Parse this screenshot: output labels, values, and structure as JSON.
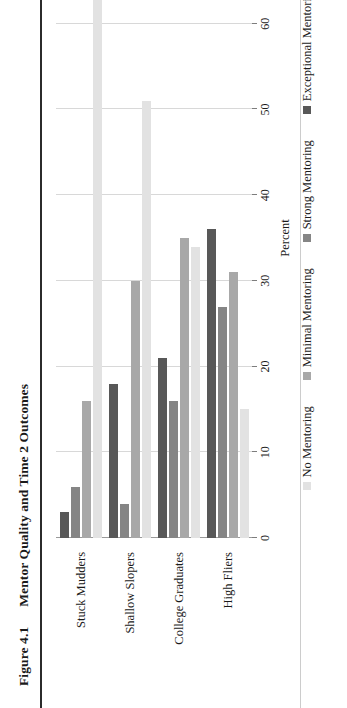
{
  "figure": {
    "number": "Figure 4.1",
    "title": "Mentor Quality and Time 2 Outcomes"
  },
  "chart_data": {
    "type": "bar",
    "orientation": "horizontal",
    "title": "Mentor Quality and Time 2 Outcomes",
    "xlabel": "",
    "ylabel": "Percent",
    "ylim": [
      0,
      70
    ],
    "yticks": [
      0,
      10,
      20,
      30,
      40,
      50,
      60,
      70
    ],
    "grid": true,
    "legend_position": "bottom",
    "categories": [
      "Stuck Mudders",
      "Shallow Slopers",
      "College Graduates",
      "High Fliers"
    ],
    "series": [
      {
        "name": "No Mentoring",
        "color": "#e2e2e2",
        "values": [
          70,
          51,
          34,
          15
        ]
      },
      {
        "name": "Minimal Mentoring",
        "color": "#a8a8a8",
        "values": [
          16,
          30,
          35,
          31
        ]
      },
      {
        "name": "Strong Mentoring",
        "color": "#858585",
        "values": [
          6,
          4,
          16,
          27
        ]
      },
      {
        "name": "Exceptional Mentoring",
        "color": "#585858",
        "values": [
          3,
          18,
          21,
          36
        ]
      }
    ]
  },
  "axis": {
    "label": "Percent",
    "ticks": [
      "0",
      "10",
      "20",
      "30",
      "40",
      "50",
      "60",
      "70"
    ]
  },
  "legend": {
    "items": [
      {
        "label": "No Mentoring",
        "color": "#e2e2e2"
      },
      {
        "label": "Minimal Mentoring",
        "color": "#a8a8a8"
      },
      {
        "label": "Strong Mentoring",
        "color": "#858585"
      },
      {
        "label": "Exceptional Mentoring",
        "color": "#585858"
      }
    ]
  }
}
